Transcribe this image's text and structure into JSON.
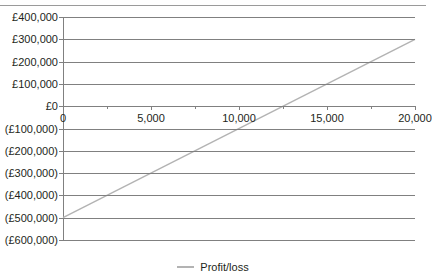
{
  "chart_data": {
    "type": "line",
    "title": "",
    "subtitle": "",
    "xlabel": "",
    "ylabel": "",
    "xlim": [
      0,
      20000
    ],
    "ylim": [
      -600000,
      400000
    ],
    "grid": true,
    "legend_position": "bottom",
    "x_tick_labels": [
      "0",
      "5,000",
      "10,000",
      "15,000",
      "20,000"
    ],
    "x_tick_values": [
      0,
      5000,
      10000,
      15000,
      20000
    ],
    "x_minor_tick_values": [
      2500,
      7500,
      12500,
      17500
    ],
    "y_tick_labels": [
      "£400,000",
      "£300,000",
      "£200,000",
      "£100,000",
      "£0",
      "(£100,000)",
      "(£200,000)",
      "(£300,000)",
      "(£400,000)",
      "(£500,000)",
      "(£600,000)"
    ],
    "y_tick_values": [
      400000,
      300000,
      200000,
      100000,
      0,
      -100000,
      -200000,
      -300000,
      -400000,
      -500000,
      -600000
    ],
    "series": [
      {
        "name": "Profit/loss",
        "color": "#b3b3b3",
        "x": [
          0,
          20000
        ],
        "values": [
          -500000,
          300000
        ]
      }
    ],
    "break_even_x": 12500,
    "legend": [
      "Profit/loss"
    ]
  },
  "legend": {
    "entry_label": "Profit/loss",
    "swatch_color": "#b3b3b3"
  },
  "axis_colors": {
    "gridline": "#808080",
    "text": "#231f20",
    "series": "#b3b3b3",
    "top_rule": "#9a9a9a"
  }
}
